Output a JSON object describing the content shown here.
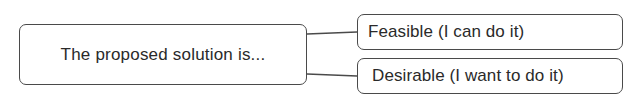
{
  "diagram": {
    "root": {
      "label": "The proposed solution is..."
    },
    "branches": [
      {
        "label": "Feasible (I can do it)"
      },
      {
        "label": "Desirable (I want to do it)"
      }
    ],
    "colors": {
      "stroke": "#4a4a4a",
      "text": "#2a2a2a",
      "background": "#ffffff"
    }
  }
}
